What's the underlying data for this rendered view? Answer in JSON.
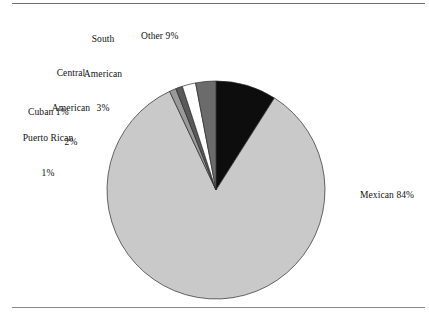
{
  "figure": {
    "kind": "pie-chart-figure",
    "has_top_rule": true,
    "has_bottom_rule": true
  },
  "labels": {
    "other": "Other 9%",
    "south_american_l1": "South",
    "south_american_l2": "American",
    "south_american_l3": "3%",
    "central_american_l1": "Central",
    "central_american_l2": "American",
    "central_american_l3": "2%",
    "cuban": "Cuban 1%",
    "puerto_rican_l1": "Puerto Rican",
    "puerto_rican_l2": "1%",
    "mexican": "Mexican 84%"
  },
  "chart_data": {
    "type": "pie",
    "title": "",
    "start_angle_deg": 0,
    "direction": "clockwise",
    "total": 100,
    "units": "percent",
    "categories": [
      "Other",
      "Mexican",
      "Puerto Rican",
      "Cuban",
      "Central American",
      "South American"
    ],
    "values": [
      9,
      84,
      1,
      1,
      2,
      3
    ],
    "slices": [
      {
        "label": "Other",
        "value": 9,
        "display": "Other 9%",
        "color": "#0d0d0d"
      },
      {
        "label": "Mexican",
        "value": 84,
        "display": "Mexican 84%",
        "color": "#c9c9c9"
      },
      {
        "label": "Puerto Rican",
        "value": 1,
        "display": "Puerto Rican 1%",
        "color": "#9a9a9a"
      },
      {
        "label": "Cuban",
        "value": 1,
        "display": "Cuban 1%",
        "color": "#5a5a5a"
      },
      {
        "label": "Central American",
        "value": 2,
        "display": "Central American 2%",
        "color": "#ffffff"
      },
      {
        "label": "South American",
        "value": 3,
        "display": "South American 3%",
        "color": "#6b6b6b"
      }
    ],
    "legend": "none",
    "labels_placement": "outside-leader",
    "colors": {
      "mexican": "#c9c9c9",
      "puerto_rican": "#9a9a9a",
      "cuban": "#5a5a5a",
      "central_american": "#ffffff",
      "south_american": "#6b6b6b",
      "other": "#0d0d0d",
      "outline": "#2b2b2b",
      "rule": "#6e6e6e"
    },
    "geometry": {
      "center_x": 216,
      "center_y": 190,
      "radius": 109
    }
  }
}
